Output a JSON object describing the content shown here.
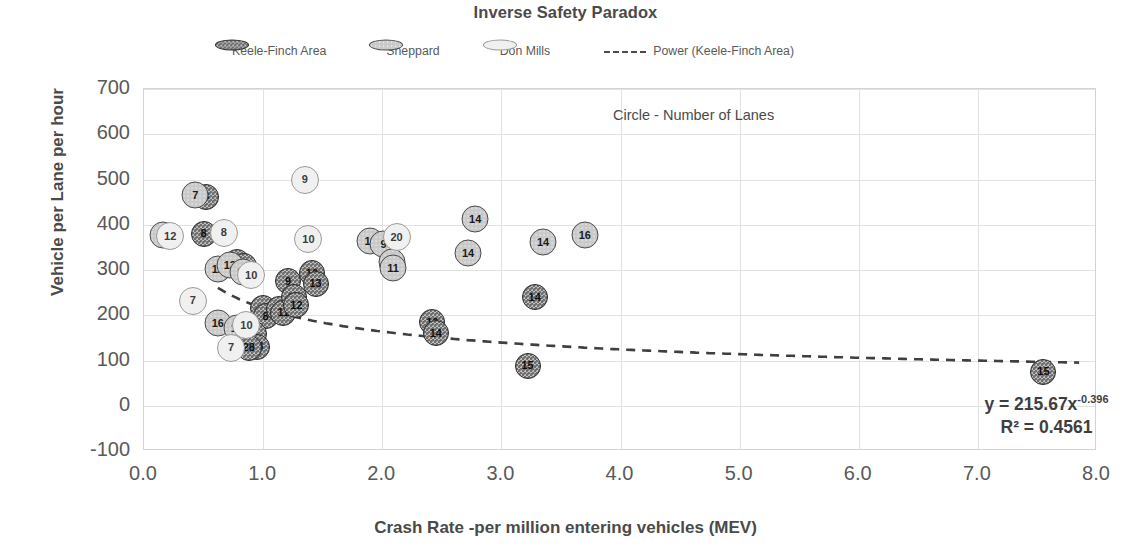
{
  "chart_data": {
    "type": "scatter",
    "title": "Inverse Safety Paradox",
    "xlabel": "Crash Rate -per million entering vehicles (MEV)",
    "ylabel": "Vehicle per Lane per hour",
    "xlim": [
      0.0,
      8.0
    ],
    "ylim": [
      -100,
      700
    ],
    "xticks": [
      "0.0",
      "1.0",
      "2.0",
      "3.0",
      "4.0",
      "5.0",
      "6.0",
      "7.0",
      "8.0"
    ],
    "yticks": [
      "700",
      "600",
      "500",
      "400",
      "300",
      "200",
      "100",
      "0",
      "-100"
    ],
    "grid": true,
    "legend_position": "top",
    "annotation": "Circle - Number of Lanes",
    "trendline": {
      "label": "Power (Keele-Finch Area)",
      "equation": "y = 215.67x",
      "exponent": "-0.396",
      "r2_label": "R² = 0.4561",
      "coefficient": 215.67,
      "power": -0.396,
      "r_squared": 0.4561,
      "style": "dashed"
    },
    "legend_entries": [
      {
        "name": "Keele-Finch Area",
        "series": "keele",
        "color": "#6f6f6f"
      },
      {
        "name": "Sheppard",
        "series": "sheppard",
        "color": "#c9c9c9"
      },
      {
        "name": "Don Mills",
        "series": "donmills",
        "color": "#f0f0f0"
      }
    ],
    "series": [
      {
        "name": "Keele-Finch Area",
        "key": "keele",
        "points": [
          {
            "x": 0.52,
            "y": 462,
            "label": "8"
          },
          {
            "x": 0.5,
            "y": 380,
            "label": "8"
          },
          {
            "x": 0.78,
            "y": 318,
            "label": "13"
          },
          {
            "x": 0.84,
            "y": 308,
            "label": "13"
          },
          {
            "x": 1.0,
            "y": 215,
            "label": "9"
          },
          {
            "x": 1.02,
            "y": 198,
            "label": "8"
          },
          {
            "x": 1.13,
            "y": 213,
            "label": "11"
          },
          {
            "x": 1.17,
            "y": 205,
            "label": "11"
          },
          {
            "x": 1.21,
            "y": 275,
            "label": "9"
          },
          {
            "x": 1.26,
            "y": 240,
            "label": "12"
          },
          {
            "x": 1.28,
            "y": 222,
            "label": "12"
          },
          {
            "x": 1.41,
            "y": 293,
            "label": "12"
          },
          {
            "x": 1.44,
            "y": 270,
            "label": "13"
          },
          {
            "x": 0.88,
            "y": 170,
            "label": "10"
          },
          {
            "x": 0.92,
            "y": 158,
            "label": "9"
          },
          {
            "x": 0.95,
            "y": 130,
            "label": "28"
          },
          {
            "x": 0.88,
            "y": 128,
            "label": "28"
          },
          {
            "x": 2.42,
            "y": 185,
            "label": "13"
          },
          {
            "x": 2.45,
            "y": 160,
            "label": "14"
          },
          {
            "x": 3.28,
            "y": 240,
            "label": "14"
          },
          {
            "x": 3.22,
            "y": 88,
            "label": "15"
          },
          {
            "x": 7.55,
            "y": 75,
            "label": "15"
          }
        ]
      },
      {
        "name": "Sheppard",
        "key": "sheppard",
        "points": [
          {
            "x": 0.43,
            "y": 465,
            "label": "7"
          },
          {
            "x": 0.16,
            "y": 378,
            "label": "3"
          },
          {
            "x": 1.9,
            "y": 365,
            "label": "11"
          },
          {
            "x": 2.01,
            "y": 358,
            "label": "9"
          },
          {
            "x": 2.08,
            "y": 318,
            "label": "15"
          },
          {
            "x": 2.09,
            "y": 305,
            "label": "11"
          },
          {
            "x": 2.78,
            "y": 413,
            "label": "14"
          },
          {
            "x": 2.72,
            "y": 338,
            "label": "14"
          },
          {
            "x": 3.35,
            "y": 362,
            "label": "14"
          },
          {
            "x": 3.7,
            "y": 378,
            "label": "16"
          },
          {
            "x": 0.62,
            "y": 302,
            "label": "12"
          },
          {
            "x": 0.72,
            "y": 310,
            "label": "13"
          },
          {
            "x": 0.83,
            "y": 295,
            "label": "11"
          },
          {
            "x": 0.62,
            "y": 183,
            "label": "16"
          },
          {
            "x": 0.78,
            "y": 172,
            "label": "12"
          }
        ]
      },
      {
        "name": "Don Mills",
        "key": "donmills",
        "points": [
          {
            "x": 1.35,
            "y": 500,
            "label": "9"
          },
          {
            "x": 0.67,
            "y": 382,
            "label": "8"
          },
          {
            "x": 0.22,
            "y": 375,
            "label": "12"
          },
          {
            "x": 1.38,
            "y": 368,
            "label": "10"
          },
          {
            "x": 2.12,
            "y": 372,
            "label": "20"
          },
          {
            "x": 0.9,
            "y": 288,
            "label": "10"
          },
          {
            "x": 0.41,
            "y": 232,
            "label": "7"
          },
          {
            "x": 0.86,
            "y": 178,
            "label": "10"
          },
          {
            "x": 0.73,
            "y": 128,
            "label": "7"
          }
        ]
      }
    ]
  }
}
